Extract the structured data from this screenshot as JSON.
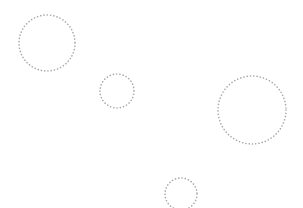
{
  "canvas": {
    "width": 303,
    "height": 208,
    "background": "#ffffff"
  },
  "style": {
    "stroke": "#a8a8a8",
    "stroke_width": 1.6,
    "dash": "0.1 3.2"
  },
  "circles": [
    {
      "id": "circle-1",
      "cx": 47,
      "cy": 43,
      "r": 28
    },
    {
      "id": "circle-2",
      "cx": 117,
      "cy": 91,
      "r": 17
    },
    {
      "id": "circle-3",
      "cx": 252,
      "cy": 110,
      "r": 34
    },
    {
      "id": "circle-4",
      "cx": 181,
      "cy": 194,
      "r": 16
    }
  ]
}
